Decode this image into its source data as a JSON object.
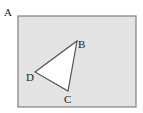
{
  "diagram": {
    "rectangle": {
      "label": "A",
      "x": 18,
      "y": 16,
      "width": 118,
      "height": 91,
      "fill": "#e4e4e4",
      "stroke": "#808080"
    },
    "triangle": {
      "fill": "#ffffff",
      "stroke": "#555555",
      "vertices": [
        {
          "label": "B",
          "x": 77,
          "y": 41
        },
        {
          "label": "C",
          "x": 68,
          "y": 91
        },
        {
          "label": "D",
          "x": 35,
          "y": 72
        }
      ]
    },
    "labels": {
      "a": "A",
      "b": "B",
      "c": "C",
      "d": "D"
    }
  }
}
